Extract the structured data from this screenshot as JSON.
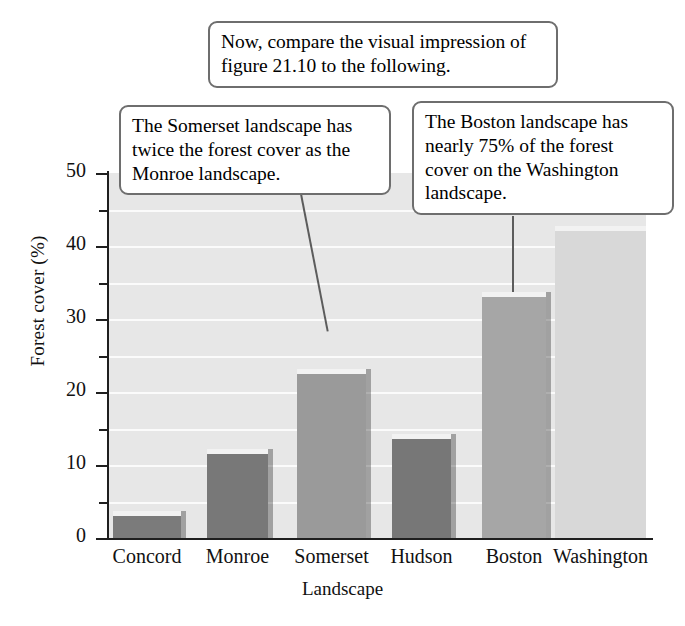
{
  "chart_data": {
    "type": "bar",
    "title": "",
    "xlabel": "Landscape",
    "ylabel": "Forest cover (%)",
    "categories": [
      "Concord",
      "Monroe",
      "Somerset",
      "Hudson",
      "Boston",
      "Washington"
    ],
    "values": [
      3,
      11.5,
      22.5,
      13.5,
      33,
      42
    ],
    "ylim": [
      0,
      50
    ],
    "ytick_labels": [
      "0",
      "10",
      "20",
      "30",
      "40",
      "50"
    ],
    "ytick_values": [
      0,
      10,
      20,
      30,
      40,
      50
    ],
    "minor_tick_values": [
      5,
      15,
      25,
      35,
      45
    ],
    "gridlines": [
      5,
      10,
      15,
      20,
      25,
      30,
      35,
      40,
      45
    ],
    "grid": true,
    "legend": "none",
    "bar_colors": [
      "#7b7b7b",
      "#787878",
      "#9a9a9a",
      "#777777",
      "#a6a6a6",
      "#d8d8d8"
    ],
    "plot_background": "#e7e7e7",
    "gridline_color": "#fbfbfb",
    "axis_color": "#1f1f1f"
  },
  "annotations": [
    {
      "id": "top-note",
      "text": "Now, compare the visual impression of figure 21.10 to the following.",
      "points_to": ""
    },
    {
      "id": "somerset-note",
      "text": "The Somerset landscape has twice the forest cover as the Monroe landscape.",
      "points_to": "Somerset"
    },
    {
      "id": "boston-note",
      "text": "The Boston landscape has nearly 75% of the forest cover on the Washington landscape.",
      "points_to": "Boston"
    }
  ],
  "colors": {
    "callout_border": "#6e6e6e",
    "callout_fill": "#ffffff",
    "leader_line": "#5c5c5c",
    "text": "#111111"
  }
}
